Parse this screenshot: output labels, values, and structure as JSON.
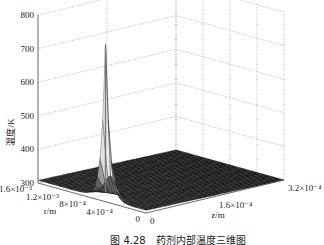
{
  "chart_data": {
    "type": "surface3d",
    "title": "",
    "caption": "图 4.28　药剂内部温度三维图",
    "zlabel": "温度/K",
    "xlabel": "z/m",
    "ylabel": "r/m",
    "zlim": [
      300,
      800
    ],
    "zticks": [
      "300",
      "400",
      "500",
      "600",
      "700",
      "800"
    ],
    "z_axis_ticks": [
      {
        "label": "0",
        "value": 0
      },
      {
        "label": "1.6×10⁻⁴",
        "value": 0.00016
      },
      {
        "label": "3.2×10⁻⁴",
        "value": 0.00032
      }
    ],
    "r_axis_ticks": [
      {
        "label": "0",
        "value": 0
      },
      {
        "label": "4×10⁻⁴",
        "value": 0.0004
      },
      {
        "label": "8×10⁻⁴",
        "value": 0.0008
      },
      {
        "label": "1.2×10⁻³",
        "value": 0.0012
      },
      {
        "label": "1.6×10⁻³",
        "value": 0.0016
      }
    ],
    "xlim": [
      0,
      0.00032
    ],
    "ylim": [
      0,
      0.0016
    ],
    "surface": {
      "base_temperature": 300,
      "peak_temperature": 760,
      "peak_location": {
        "z": 0,
        "r": 0.0006
      },
      "description": "Flat surface near 300 K with a sharp narrow temperature spike at z≈0 near r≈6×10⁻⁴ m"
    },
    "grid": true
  }
}
